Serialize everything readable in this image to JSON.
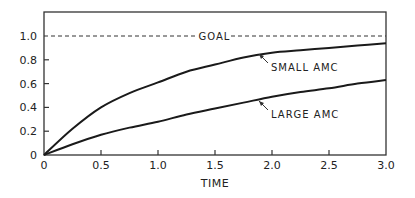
{
  "chart_data": {
    "type": "line",
    "title": "",
    "xlabel": "TIME",
    "ylabel": "",
    "xlim": [
      0,
      3.0
    ],
    "ylim": [
      0,
      1.15
    ],
    "grid": false,
    "legend": "none (inline annotations)",
    "x_ticks": [
      "0",
      "0.5",
      "1.0",
      "1.5",
      "2.0",
      "2.5",
      "3.0"
    ],
    "y_ticks": [
      "0",
      "0.2",
      "0.4",
      "0.6",
      "0.8",
      "1.0"
    ],
    "x": [
      0,
      0.25,
      0.5,
      0.75,
      1.0,
      1.25,
      1.5,
      1.75,
      2.0,
      2.25,
      2.5,
      2.75,
      3.0
    ],
    "series": [
      {
        "name": "SMALL AMC",
        "values": [
          0,
          0.22,
          0.4,
          0.52,
          0.61,
          0.7,
          0.76,
          0.82,
          0.86,
          0.88,
          0.9,
          0.92,
          0.94
        ]
      },
      {
        "name": "LARGE AMC",
        "values": [
          0,
          0.09,
          0.17,
          0.23,
          0.28,
          0.34,
          0.39,
          0.44,
          0.49,
          0.53,
          0.56,
          0.6,
          0.63
        ]
      }
    ],
    "reference_lines": [
      {
        "label": "GOAL",
        "y": 1.0,
        "style": "dashed"
      }
    ],
    "annotations": [
      {
        "text": "SMALL AMC",
        "points_to": {
          "x": 1.9,
          "y": 0.85
        }
      },
      {
        "text": "LARGE AMC",
        "points_to": {
          "x": 1.9,
          "y": 0.47
        }
      },
      {
        "text": "GOAL",
        "on_line_y": 1.0
      }
    ]
  },
  "labels": {
    "xlabel": "TIME",
    "goal": "GOAL",
    "small": "SMALL AMC",
    "large": "LARGE AMC",
    "x_ticks": [
      "0",
      "0.5",
      "1.0",
      "1.5",
      "2.0",
      "2.5",
      "3.0"
    ],
    "y_ticks": [
      "0",
      "0.2",
      "0.4",
      "0.6",
      "0.8",
      "1.0"
    ]
  }
}
